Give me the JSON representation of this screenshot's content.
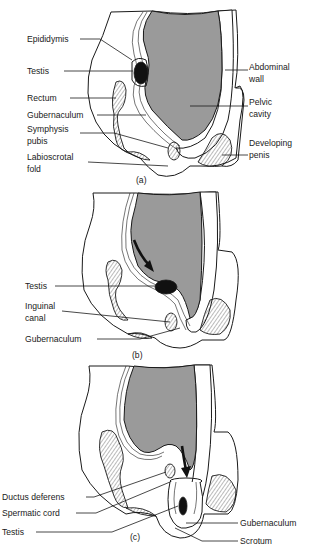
{
  "figure": {
    "colors": {
      "cavity": "#9a9a9a",
      "ink": "#1a1a1a",
      "testis": "#111111",
      "background": "#ffffff"
    },
    "panels": [
      {
        "id": "a",
        "caption": "(a)",
        "labels_left": [
          {
            "name": "epididymis",
            "lines": [
              "Epididymis"
            ]
          },
          {
            "name": "testis",
            "lines": [
              "Testis"
            ]
          },
          {
            "name": "rectum",
            "lines": [
              "Rectum"
            ]
          },
          {
            "name": "gubernaculum",
            "lines": [
              "Gubernaculum"
            ]
          },
          {
            "name": "symphysis-pubis",
            "lines": [
              "Symphysis",
              "pubis"
            ]
          },
          {
            "name": "labioscrotal-fold",
            "lines": [
              "Labioscrotal",
              "fold"
            ]
          }
        ],
        "labels_right": [
          {
            "name": "abdominal-wall",
            "lines": [
              "Abdominal",
              "wall"
            ]
          },
          {
            "name": "pelvic-cavity",
            "lines": [
              "Pelvic",
              "cavity"
            ]
          },
          {
            "name": "developing-penis",
            "lines": [
              "Developing",
              "penis"
            ]
          }
        ]
      },
      {
        "id": "b",
        "caption": "(b)",
        "labels_left": [
          {
            "name": "testis",
            "lines": [
              "Testis"
            ]
          },
          {
            "name": "inguinal-canal",
            "lines": [
              "Inguinal",
              "canal"
            ]
          },
          {
            "name": "gubernaculum",
            "lines": [
              "Gubernaculum"
            ]
          }
        ],
        "labels_right": []
      },
      {
        "id": "c",
        "caption": "(c)",
        "labels_left": [
          {
            "name": "ductus-deferens",
            "lines": [
              "Ductus deferens"
            ]
          },
          {
            "name": "spermatic-cord",
            "lines": [
              "Spermatic cord"
            ]
          },
          {
            "name": "testis",
            "lines": [
              "Testis"
            ]
          }
        ],
        "labels_right": [
          {
            "name": "gubernaculum",
            "lines": [
              "Gubernaculum"
            ]
          },
          {
            "name": "scrotum",
            "lines": [
              "Scrotum"
            ]
          }
        ]
      }
    ]
  }
}
